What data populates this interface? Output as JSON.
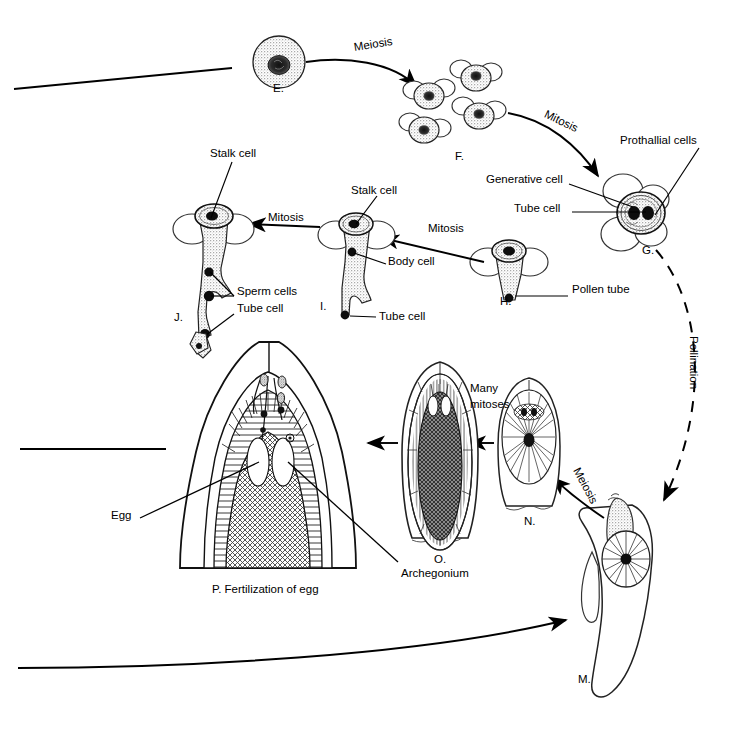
{
  "diagram": {
    "colors": {
      "ink": "#000000",
      "background": "#ffffff",
      "cytoplasm_stipple": "#b9b9b9",
      "nucleus_dark": "#1a1a1a",
      "archegonium_fill": "#707070",
      "gametophyte_fill": "#8a8a8a"
    },
    "stages": [
      {
        "id": "E.",
        "name": "microspore-mother-cell",
        "x": 279,
        "y": 88
      },
      {
        "id": "F.",
        "name": "microspore-tetrad",
        "x": 461,
        "y": 156
      },
      {
        "id": "G.",
        "name": "pollen-grain",
        "x": 648,
        "y": 250
      },
      {
        "id": "H.",
        "name": "germinating-pollen-grain",
        "x": 505,
        "y": 301
      },
      {
        "id": "I.",
        "name": "pollen-tube-with-body-cell",
        "x": 322,
        "y": 306
      },
      {
        "id": "J.",
        "name": "pollen-tube-with-sperm-cells",
        "x": 177,
        "y": 317
      },
      {
        "id": "M.",
        "name": "ovule-with-megaspore",
        "x": 581,
        "y": 679
      },
      {
        "id": "N.",
        "name": "young-female-gametophyte",
        "x": 529,
        "y": 521
      },
      {
        "id": "O.",
        "name": "mature-female-gametophyte",
        "x": 440,
        "y": 559
      },
      {
        "id": "P.",
        "name": "fertilization",
        "x": 0,
        "y": 0
      }
    ],
    "labels": [
      {
        "key": "meiosis-top",
        "text": "Meiosis",
        "x": 354,
        "y": 46
      },
      {
        "key": "mitosis-f-to-g",
        "text": "Mitosis",
        "x": 548,
        "y": 112,
        "rotate": 22
      },
      {
        "key": "prothallial-cells",
        "text": "Prothallial cells",
        "x": 620,
        "y": 140
      },
      {
        "key": "generative-cell",
        "text": "Generative cell",
        "x": 489,
        "y": 179
      },
      {
        "key": "tube-cell-g",
        "text": "Tube cell",
        "x": 518,
        "y": 208
      },
      {
        "key": "pollen-tube",
        "text": "Pollen tube",
        "x": 573,
        "y": 289
      },
      {
        "key": "mitosis-h-to-i",
        "text": "Mitosis",
        "x": 432,
        "y": 228
      },
      {
        "key": "mitosis-i-to-j",
        "text": "Mitosis",
        "x": 272,
        "y": 217
      },
      {
        "key": "stalk-cell-j",
        "text": "Stalk cell",
        "x": 212,
        "y": 152
      },
      {
        "key": "stalk-cell-i",
        "text": "Stalk cell",
        "x": 352,
        "y": 190
      },
      {
        "key": "body-cell",
        "text": "Body cell",
        "x": 389,
        "y": 261
      },
      {
        "key": "sperm-cells",
        "text": "Sperm cells",
        "x": 238,
        "y": 291
      },
      {
        "key": "tube-cell-j",
        "text": "Tube cell",
        "x": 238,
        "y": 308
      },
      {
        "key": "tube-cell-i",
        "text": "Tube cell",
        "x": 380,
        "y": 315
      },
      {
        "key": "pollination",
        "text": "Pollination",
        "x": 694,
        "y": 346,
        "rotate": 90
      },
      {
        "key": "many-mitoses-1",
        "text": "Many",
        "x": 470,
        "y": 388
      },
      {
        "key": "many-mitoses-2",
        "text": "mitoses",
        "x": 470,
        "y": 404
      },
      {
        "key": "meiosis-bottom",
        "text": "Meiosis",
        "x": 578,
        "y": 468,
        "rotate": 62
      },
      {
        "key": "egg",
        "text": "Egg",
        "x": 112,
        "y": 515
      },
      {
        "key": "archegonium",
        "text": "Archegonium",
        "x": 402,
        "y": 567
      },
      {
        "key": "fertilization",
        "text": "P. Fertilization of egg",
        "x": 213,
        "y": 588
      }
    ],
    "arrows": [
      {
        "key": "meiosis-e-to-f",
        "type": "solid-curved",
        "from": "E.",
        "to": "F."
      },
      {
        "key": "mitosis-f-to-g",
        "type": "solid-curved",
        "from": "F.",
        "to": "G."
      },
      {
        "key": "pollination-arc",
        "type": "dashed-curved",
        "from": "G.",
        "to": "M."
      },
      {
        "key": "meiosis-m-to-n",
        "type": "solid-curved",
        "from": "M.",
        "to": "N."
      },
      {
        "key": "n-to-o",
        "type": "solid-straight",
        "from": "N.",
        "to": "O."
      },
      {
        "key": "o-to-p",
        "type": "solid-straight",
        "from": "O.",
        "to": "P."
      },
      {
        "key": "mitosis-h-to-i",
        "type": "solid-straight",
        "from": "H.",
        "to": "I."
      },
      {
        "key": "mitosis-i-to-j",
        "type": "solid-straight",
        "from": "I.",
        "to": "J."
      },
      {
        "key": "cycle-bottom",
        "type": "solid-curved",
        "from": "off-page-left",
        "to": "M."
      }
    ],
    "edge_lines": [
      {
        "key": "top-left-cut-line",
        "x1": 14,
        "y1": 89,
        "x2": 232,
        "y2": 68
      },
      {
        "key": "middle-left-cut-line",
        "x1": 20,
        "y1": 449,
        "x2": 166,
        "y2": 449
      }
    ]
  }
}
